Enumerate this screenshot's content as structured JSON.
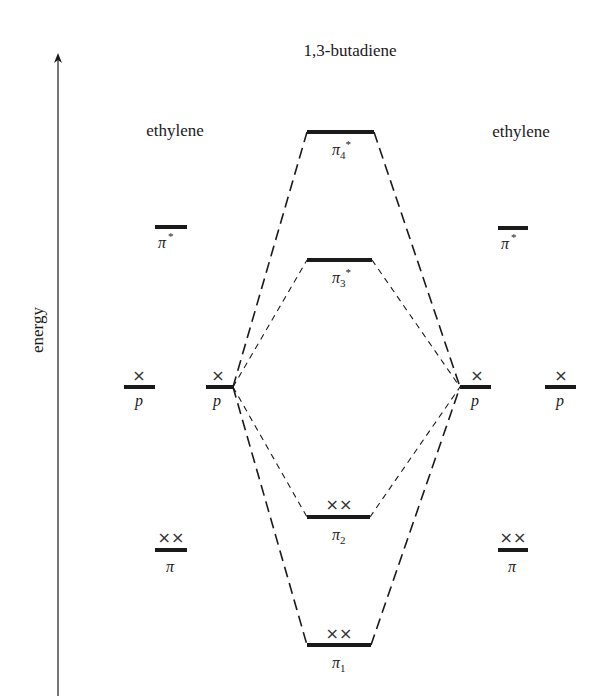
{
  "diagram": {
    "title": "1,3-butadiene",
    "axis_label": "energy",
    "left_group_label": "ethylene",
    "right_group_label": "ethylene",
    "colors": {
      "ink": "#1a1a1a",
      "background": "#ffffff"
    },
    "butadiene_levels": [
      {
        "id": "pi4",
        "label": "π",
        "subscript": "4",
        "superscript": "*",
        "electrons": ""
      },
      {
        "id": "pi3",
        "label": "π",
        "subscript": "3",
        "superscript": "*",
        "electrons": ""
      },
      {
        "id": "pi2",
        "label": "π",
        "subscript": "2",
        "superscript": "",
        "electrons": "××"
      },
      {
        "id": "pi1",
        "label": "π",
        "subscript": "1",
        "superscript": "",
        "electrons": "××"
      }
    ],
    "left_ethylene": {
      "pi_star": {
        "label": "π",
        "superscript": "*"
      },
      "p_outer": {
        "label": "p",
        "electrons": "×"
      },
      "p_inner": {
        "label": "p",
        "electrons": "×"
      },
      "pi": {
        "label": "π",
        "electrons": "××"
      }
    },
    "right_ethylene": {
      "pi_star": {
        "label": "π",
        "superscript": "*"
      },
      "p_inner": {
        "label": "p",
        "electrons": "×"
      },
      "p_outer": {
        "label": "p",
        "electrons": "×"
      },
      "pi": {
        "label": "π",
        "electrons": "××"
      }
    }
  }
}
